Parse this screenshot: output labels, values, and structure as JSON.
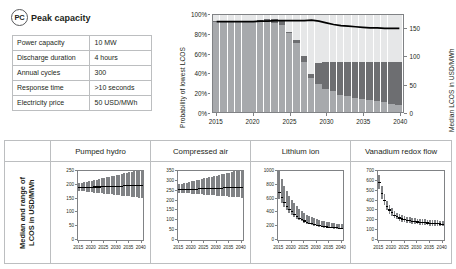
{
  "card": {
    "badge_abbrev": "PC",
    "badge_label": "Peak capacity",
    "spec_table": {
      "rows": [
        {
          "key": "Power capacity",
          "value": "10 MW"
        },
        {
          "key": "Discharge duration",
          "value": "4 hours"
        },
        {
          "key": "Annual cycles",
          "value": "300"
        },
        {
          "key": "Response time",
          "value": ">10 seconds"
        },
        {
          "key": "Electricity price",
          "value": "50 USD/MWh"
        }
      ]
    }
  },
  "colors": {
    "segment_light": "#e6e7e8",
    "segment_dark": "#6d6e71",
    "segment_mid": "#a7a9ac",
    "median_line": "#000000",
    "axis": "#808285",
    "border": "#bcbec0",
    "text": "#231f20"
  },
  "chart_data": [
    {
      "id": "main-probability-chart",
      "type": "bar",
      "title": "",
      "xlabel": "",
      "ylabel": "Probability of lowest LCOS",
      "ylabel_right": "Median LCOS in USD/MWh",
      "ylim": [
        0,
        100
      ],
      "ylim_right": [
        0,
        175
      ],
      "ytick_labels": [
        "0%",
        "20%",
        "40%",
        "60%",
        "80%",
        "100%"
      ],
      "ytick_values": [
        0,
        20,
        40,
        60,
        80,
        100
      ],
      "ytick_labels_right": [
        "0",
        "50",
        "100",
        "150"
      ],
      "ytick_values_right": [
        0,
        50,
        100,
        150
      ],
      "xtick_labels": [
        "2015",
        "2020",
        "2025",
        "2030",
        "2035",
        "2040"
      ],
      "xtick_values": [
        2015,
        2020,
        2025,
        2030,
        2035,
        2040
      ],
      "x": [
        2015,
        2016,
        2017,
        2018,
        2019,
        2020,
        2021,
        2022,
        2023,
        2024,
        2025,
        2026,
        2027,
        2028,
        2029,
        2030,
        2031,
        2032,
        2033,
        2034,
        2035,
        2036,
        2037,
        2038,
        2039,
        2040
      ],
      "grid": false,
      "legend_position": "none",
      "stacked_series": [
        {
          "name": "Pumped hydro",
          "color": "#a7a9ac",
          "values": [
            93,
            93,
            93,
            93,
            93,
            93,
            93,
            93,
            92,
            90,
            81,
            71,
            52,
            35,
            29,
            24,
            22,
            18,
            16,
            14,
            13,
            12,
            11,
            10,
            8,
            7
          ]
        },
        {
          "name": "Compressed air",
          "color": "#6d6e71",
          "values": [
            1,
            1,
            1,
            1,
            1,
            1,
            2,
            3,
            4,
            5,
            2,
            3,
            6,
            4,
            22,
            28,
            30,
            34,
            36,
            38,
            39,
            40,
            41,
            42,
            44,
            45
          ]
        },
        {
          "name": "Other technologies",
          "color": "#e6e7e8",
          "values": [
            6,
            6,
            6,
            6,
            6,
            6,
            5,
            4,
            4,
            5,
            17,
            26,
            42,
            61,
            49,
            48,
            48,
            48,
            48,
            48,
            48,
            48,
            48,
            48,
            48,
            48
          ]
        }
      ],
      "median_line": {
        "name": "Median LCOS",
        "color": "#000000",
        "values": [
          163,
          163,
          163,
          163,
          163,
          163,
          164,
          164,
          165,
          165,
          165,
          165,
          165,
          166,
          164,
          161,
          158,
          156,
          155,
          154,
          153,
          152,
          152,
          151,
          151,
          151
        ]
      }
    },
    {
      "id": "pumped-hydro-panel",
      "type": "area",
      "title": "Pumped hydro",
      "xlabel": "",
      "ylabel": "Median and range of LCOS in USD/MWh",
      "ylim": [
        0,
        250
      ],
      "ytick_labels": [
        "0",
        "50",
        "100",
        "150",
        "200",
        "250"
      ],
      "ytick_values": [
        0,
        50,
        100,
        150,
        200,
        250
      ],
      "xtick_labels": [
        "2015",
        "2020",
        "2025",
        "2030",
        "2035",
        "2040"
      ],
      "xtick_values": [
        2015,
        2020,
        2025,
        2030,
        2035,
        2040
      ],
      "x": [
        2015,
        2016,
        2017,
        2018,
        2019,
        2020,
        2021,
        2022,
        2023,
        2024,
        2025,
        2026,
        2027,
        2028,
        2029,
        2030,
        2031,
        2032,
        2033,
        2034,
        2035,
        2036,
        2037,
        2038,
        2039,
        2040
      ],
      "median": [
        192,
        192,
        192,
        193,
        193,
        193,
        194,
        194,
        194,
        195,
        195,
        195,
        196,
        196,
        196,
        197,
        197,
        197,
        198,
        198,
        198,
        199,
        199,
        199,
        200,
        200
      ],
      "lower": [
        178,
        177,
        176,
        175,
        174,
        173,
        172,
        171,
        170,
        169,
        168,
        167,
        166,
        165,
        164,
        163,
        162,
        161,
        160,
        159,
        158,
        157,
        156,
        155,
        154,
        153
      ],
      "upper": [
        205,
        207,
        209,
        211,
        213,
        215,
        217,
        219,
        221,
        223,
        225,
        227,
        229,
        231,
        233,
        235,
        237,
        239,
        241,
        243,
        245,
        247,
        249,
        251,
        253,
        255
      ]
    },
    {
      "id": "compressed-air-panel",
      "type": "area",
      "title": "Compressed air",
      "xlabel": "",
      "ylabel": "Median and range of LCOS in USD/MWh",
      "ylim": [
        0,
        350
      ],
      "ytick_labels": [
        "0",
        "50",
        "100",
        "150",
        "200",
        "250",
        "300",
        "350"
      ],
      "ytick_values": [
        0,
        50,
        100,
        150,
        200,
        250,
        300,
        350
      ],
      "xtick_labels": [
        "2015",
        "2020",
        "2025",
        "2030",
        "2035",
        "2040"
      ],
      "xtick_values": [
        2015,
        2020,
        2025,
        2030,
        2035,
        2040
      ],
      "x": [
        2015,
        2016,
        2017,
        2018,
        2019,
        2020,
        2021,
        2022,
        2023,
        2024,
        2025,
        2026,
        2027,
        2028,
        2029,
        2030,
        2031,
        2032,
        2033,
        2034,
        2035,
        2036,
        2037,
        2038,
        2039,
        2040
      ],
      "median": [
        258,
        258,
        259,
        259,
        260,
        260,
        261,
        261,
        262,
        262,
        263,
        263,
        264,
        264,
        265,
        265,
        266,
        266,
        267,
        267,
        268,
        268,
        269,
        269,
        270,
        270
      ],
      "lower": [
        240,
        239,
        238,
        237,
        236,
        235,
        234,
        233,
        232,
        231,
        230,
        229,
        228,
        227,
        226,
        225,
        224,
        223,
        222,
        221,
        220,
        219,
        218,
        217,
        216,
        215
      ],
      "upper": [
        282,
        285,
        288,
        291,
        294,
        297,
        300,
        303,
        306,
        309,
        312,
        315,
        318,
        321,
        324,
        327,
        330,
        333,
        336,
        339,
        342,
        345,
        348,
        351,
        354,
        357
      ]
    },
    {
      "id": "lithium-ion-panel",
      "type": "area",
      "title": "Lithium ion",
      "xlabel": "",
      "ylabel": "Median and range of LCOS in USD/MWh",
      "ylim": [
        0,
        1000
      ],
      "ytick_labels": [
        "0",
        "200",
        "400",
        "600",
        "800",
        "1000"
      ],
      "ytick_values": [
        0,
        200,
        400,
        600,
        800,
        1000
      ],
      "xtick_labels": [
        "2015",
        "2020",
        "2025",
        "2030",
        "2035",
        "2040"
      ],
      "xtick_values": [
        2015,
        2020,
        2025,
        2030,
        2035,
        2040
      ],
      "x": [
        2015,
        2016,
        2017,
        2018,
        2019,
        2020,
        2021,
        2022,
        2023,
        2024,
        2025,
        2026,
        2027,
        2028,
        2029,
        2030,
        2031,
        2032,
        2033,
        2034,
        2035,
        2036,
        2037,
        2038,
        2039,
        2040
      ],
      "median": [
        700,
        620,
        555,
        500,
        455,
        415,
        380,
        350,
        325,
        302,
        283,
        267,
        253,
        241,
        231,
        222,
        214,
        208,
        202,
        197,
        193,
        189,
        186,
        183,
        180,
        178
      ],
      "lower": [
        600,
        535,
        480,
        435,
        397,
        363,
        334,
        309,
        287,
        268,
        252,
        238,
        226,
        215,
        206,
        198,
        191,
        185,
        180,
        176,
        172,
        169,
        166,
        163,
        161,
        159
      ],
      "upper": [
        1000,
        880,
        785,
        705,
        640,
        583,
        533,
        490,
        453,
        421,
        393,
        369,
        348,
        330,
        314,
        300,
        288,
        278,
        269,
        261,
        254,
        248,
        243,
        238,
        234,
        231
      ]
    },
    {
      "id": "vanadium-redox-flow-panel",
      "type": "area",
      "title": "Vanadium redox flow",
      "xlabel": "",
      "ylabel": "Median and range of LCOS in USD/MWh",
      "ylim": [
        0,
        700
      ],
      "ytick_labels": [
        "0",
        "100",
        "200",
        "300",
        "400",
        "500",
        "600",
        "700"
      ],
      "ytick_values": [
        0,
        100,
        200,
        300,
        400,
        500,
        600,
        700
      ],
      "xtick_labels": [
        "2015",
        "2020",
        "2025",
        "2030",
        "2035",
        "2040"
      ],
      "xtick_values": [
        2015,
        2020,
        2025,
        2030,
        2035,
        2040
      ],
      "x": [
        2015,
        2016,
        2017,
        2018,
        2019,
        2020,
        2021,
        2022,
        2023,
        2024,
        2025,
        2026,
        2027,
        2028,
        2029,
        2030,
        2031,
        2032,
        2033,
        2034,
        2035,
        2036,
        2037,
        2038,
        2039,
        2040
      ],
      "median": [
        590,
        480,
        405,
        350,
        310,
        280,
        258,
        242,
        229,
        219,
        211,
        205,
        199,
        195,
        191,
        188,
        185,
        182,
        180,
        178,
        176,
        174,
        172,
        170,
        168,
        166
      ],
      "lower": [
        520,
        420,
        352,
        303,
        268,
        242,
        222,
        208,
        196,
        187,
        180,
        174,
        169,
        165,
        161,
        158,
        155,
        153,
        151,
        149,
        147,
        146,
        144,
        143,
        141,
        140
      ],
      "upper": [
        660,
        545,
        462,
        400,
        355,
        321,
        296,
        277,
        262,
        251,
        242,
        235,
        229,
        224,
        220,
        216,
        213,
        210,
        208,
        206,
        204,
        202,
        200,
        199,
        197,
        196
      ]
    }
  ],
  "bottom_row": {
    "row_label_line1": "Median and range of",
    "row_label_line2": "LCOS in USD/MWh"
  }
}
